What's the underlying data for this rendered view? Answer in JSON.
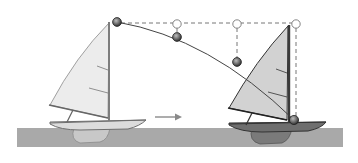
{
  "diagram": {
    "colors": {
      "background": "#ffffff",
      "water": "#a9a9a9",
      "sail_left": "#ececec",
      "sail_right": "#d2d2d2",
      "hull_left": "#dcdcdc",
      "hull_right": "#6e6e6e",
      "keel_left": "#c8c8c8",
      "keel_right": "#7a7a7a",
      "mast": "#7d7d7d",
      "ball_dark": "#555555",
      "ball_hollow": "#ffffff",
      "line": "#444444",
      "dashed": "#666666",
      "arrow": "#8a8a8a"
    },
    "water_band": {
      "x": 17,
      "y": 128,
      "width": 326,
      "height": 19
    },
    "motion_arrow": {
      "x1": 155,
      "y1": 117,
      "x2": 181,
      "y2": 117,
      "label": ""
    },
    "boats": [
      {
        "id": "initial",
        "mast_x": 109,
        "mast_top_y": 22,
        "mast_bottom_y": 120,
        "boom_end_x": 50,
        "boom_y": 105
      },
      {
        "id": "later",
        "mast_x": 289,
        "mast_top_y": 25,
        "mast_bottom_y": 122,
        "boom_end_x": 229,
        "boom_y": 108
      }
    ],
    "ball_positions_falling": [
      {
        "x": 117,
        "y": 22
      },
      {
        "x": 177,
        "y": 37
      },
      {
        "x": 237,
        "y": 62
      },
      {
        "x": 294,
        "y": 120
      }
    ],
    "ball_positions_reference": [
      {
        "x": 177,
        "y": 24
      },
      {
        "x": 237,
        "y": 24
      },
      {
        "x": 296,
        "y": 24
      }
    ]
  }
}
